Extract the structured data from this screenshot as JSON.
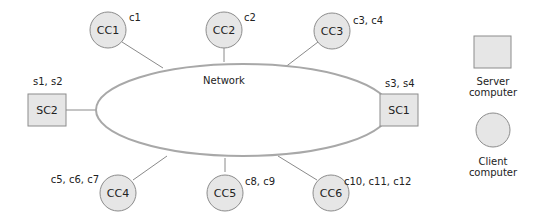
{
  "diagram": {
    "type": "network-topology",
    "network": {
      "label": "Network"
    },
    "servers": [
      {
        "id": "SC2",
        "label": "SC2",
        "items": "s1, s2"
      },
      {
        "id": "SC1",
        "label": "SC1",
        "items": "s3, s4"
      }
    ],
    "clients": [
      {
        "id": "CC1",
        "label": "CC1",
        "items": "c1"
      },
      {
        "id": "CC2",
        "label": "CC2",
        "items": "c2"
      },
      {
        "id": "CC3",
        "label": "CC3",
        "items": "c3, c4"
      },
      {
        "id": "CC4",
        "label": "CC4",
        "items": "c5, c6, c7"
      },
      {
        "id": "CC5",
        "label": "CC5",
        "items": "c8, c9"
      },
      {
        "id": "CC6",
        "label": "CC6",
        "items": "c10, c11, c12"
      }
    ],
    "legend": {
      "server": {
        "line1": "Server",
        "line2": "computer"
      },
      "client": {
        "line1": "Client",
        "line2": "computer"
      }
    },
    "colors": {
      "node_fill": "#e6e6e6",
      "node_stroke": "#8c8c8c",
      "network_stroke": "#a0a0a0",
      "link_stroke": "#8a8a8a",
      "text": "#222222"
    }
  }
}
